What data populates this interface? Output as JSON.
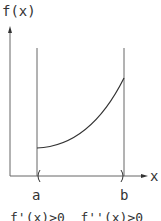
{
  "diagram": {
    "y_axis_label": "f(x)",
    "x_axis_label": "x",
    "point_a_label": "a",
    "point_b_label": "b",
    "condition_text": "f'(x)>0  f''(x)>0",
    "curve_description": "increasing, concave up on interval (a, b)",
    "colors": {
      "line": "#555555",
      "curve": "#333333",
      "text": "#333333",
      "background": "#ffffff"
    }
  }
}
